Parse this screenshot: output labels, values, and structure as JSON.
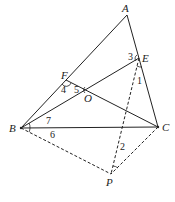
{
  "diagram": {
    "type": "geometry",
    "points": {
      "A": {
        "label": "A",
        "x": 127,
        "y": 15
      },
      "E": {
        "label": "E",
        "x": 139,
        "y": 58
      },
      "F": {
        "label": "F",
        "x": 66,
        "y": 80
      },
      "O": {
        "label": "O",
        "x": 88,
        "y": 90
      },
      "B": {
        "label": "B",
        "x": 21,
        "y": 128
      },
      "C": {
        "label": "C",
        "x": 158,
        "y": 127
      },
      "P": {
        "label": "P",
        "x": 111,
        "y": 174
      }
    },
    "segments_solid": [
      "AB",
      "AC",
      "BC",
      "BE",
      "CF"
    ],
    "segments_dashed": [
      "BP",
      "CP",
      "EP"
    ],
    "angles": {
      "a1": "1",
      "a2": "2",
      "a3": "3",
      "a4": "4",
      "a5": "5",
      "a6": "6",
      "a7": "7"
    }
  }
}
